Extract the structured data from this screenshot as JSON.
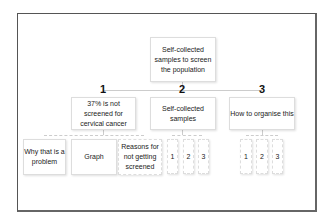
{
  "root": {
    "label": "Self-collected samples to screen the population"
  },
  "branches": [
    {
      "number": "1",
      "label": "37% is not screened for cervical cancer",
      "children": [
        "Why that is a problem",
        "Graph",
        "Reasons for not getting screened"
      ]
    },
    {
      "number": "2",
      "label": "Self-collected samples",
      "children": [
        "1",
        "2",
        "3"
      ]
    },
    {
      "number": "3",
      "label": "How to organise this",
      "children": [
        "1",
        "2",
        "3"
      ]
    }
  ]
}
